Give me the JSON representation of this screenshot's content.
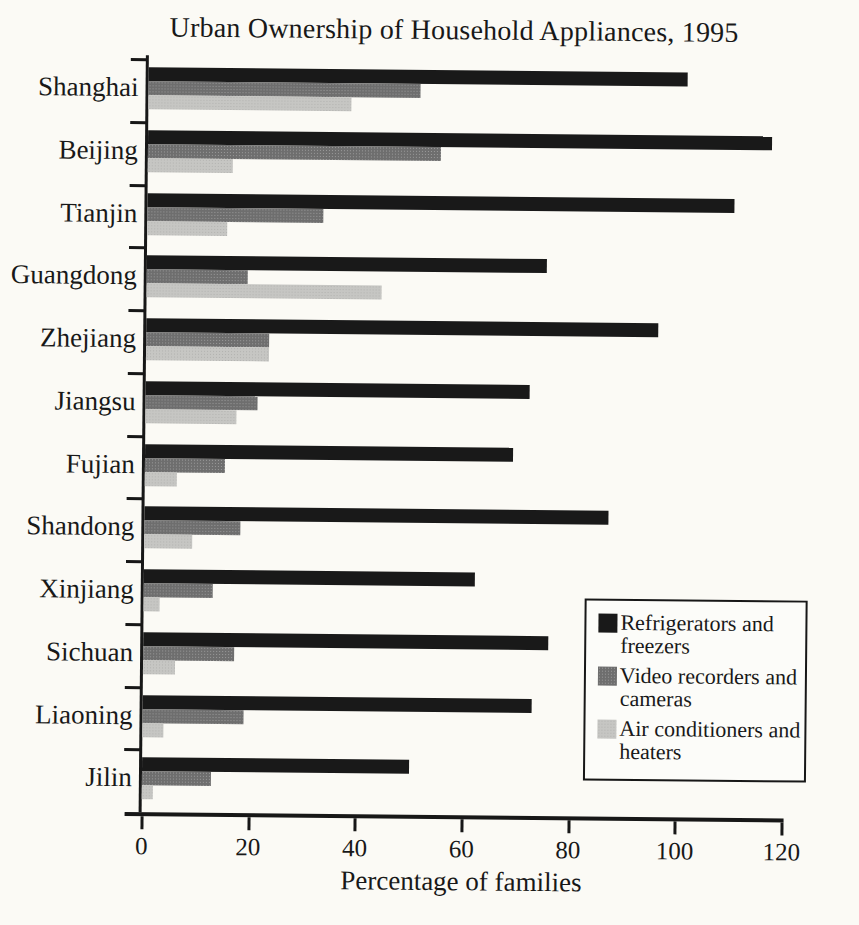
{
  "chart_data": {
    "type": "bar",
    "orientation": "horizontal",
    "title": "Urban Ownership of Household Appliances, 1995",
    "xlabel": "Percentage of families",
    "xlim": [
      0,
      120
    ],
    "x_ticks": [
      0,
      20,
      40,
      60,
      80,
      100,
      120
    ],
    "grid": false,
    "legend_position": "inside-bottom-right",
    "categories": [
      "Shanghai",
      "Beijing",
      "Tianjin",
      "Guangdong",
      "Zhejiang",
      "Jiangsu",
      "Fujian",
      "Shandong",
      "Xinjiang",
      "Sichuan",
      "Liaoning",
      "Jilin"
    ],
    "series": [
      {
        "key": "refrigerators-freezers",
        "name": "Refrigerators and freezers",
        "color": "#191919",
        "values": [
          101,
          117,
          110,
          75,
          96,
          72,
          69,
          87,
          62,
          76,
          73,
          50
        ]
      },
      {
        "key": "video-recorders-cameras",
        "name": "Video recorders and cameras",
        "color": "#6e6e6e",
        "values": [
          51,
          55,
          33,
          19,
          23,
          21,
          15,
          18,
          13,
          17,
          19,
          13
        ]
      },
      {
        "key": "air-conditioners-heaters",
        "name": "Air conditioners and heaters",
        "color": "#c6c6c3",
        "values": [
          38,
          16,
          15,
          44,
          23,
          17,
          6,
          9,
          3,
          6,
          4,
          2
        ]
      }
    ]
  }
}
